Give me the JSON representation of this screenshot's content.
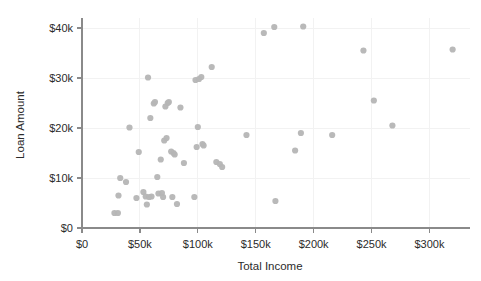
{
  "chart_data": {
    "type": "scatter",
    "title": "",
    "xlabel": "Total Income",
    "ylabel": "Loan Amount",
    "xlim": [
      0,
      335000
    ],
    "ylim": [
      0,
      42000
    ],
    "grid": true,
    "legend": null,
    "x_tick_labels": [
      "$0",
      "$50k",
      "$100k",
      "$150k",
      "$200k",
      "$250k",
      "$300k"
    ],
    "x_tick_values": [
      0,
      50000,
      100000,
      150000,
      200000,
      250000,
      300000
    ],
    "y_tick_labels": [
      "$0",
      "$10k",
      "$20k",
      "$30k",
      "$40k"
    ],
    "y_tick_values": [
      0,
      10000,
      20000,
      30000,
      40000
    ],
    "point_color": "#b5b5b5",
    "point_radius": 3.1,
    "series": [
      {
        "name": "loans",
        "points": [
          [
            28000,
            3000
          ],
          [
            31000,
            3000
          ],
          [
            31500,
            6500
          ],
          [
            33000,
            10000
          ],
          [
            38000,
            9200
          ],
          [
            41000,
            20100
          ],
          [
            47000,
            6000
          ],
          [
            49000,
            15200
          ],
          [
            53000,
            7200
          ],
          [
            55000,
            6300
          ],
          [
            56000,
            4700
          ],
          [
            57000,
            30100
          ],
          [
            58000,
            6200
          ],
          [
            59000,
            22000
          ],
          [
            60000,
            6300
          ],
          [
            62000,
            24900
          ],
          [
            63000,
            25200
          ],
          [
            65000,
            10200
          ],
          [
            66000,
            6900
          ],
          [
            68000,
            13700
          ],
          [
            69000,
            7000
          ],
          [
            70000,
            6200
          ],
          [
            71000,
            17500
          ],
          [
            72000,
            24300
          ],
          [
            73000,
            18000
          ],
          [
            74000,
            25000
          ],
          [
            75000,
            25200
          ],
          [
            77000,
            15300
          ],
          [
            78000,
            6200
          ],
          [
            79000,
            15000
          ],
          [
            80000,
            14700
          ],
          [
            82000,
            4800
          ],
          [
            85000,
            24100
          ],
          [
            88000,
            13000
          ],
          [
            97000,
            6200
          ],
          [
            98000,
            29600
          ],
          [
            99000,
            16200
          ],
          [
            100000,
            20200
          ],
          [
            101000,
            29800
          ],
          [
            103000,
            30200
          ],
          [
            104000,
            16800
          ],
          [
            105000,
            16500
          ],
          [
            112000,
            32200
          ],
          [
            116000,
            13200
          ],
          [
            119000,
            12800
          ],
          [
            121000,
            12200
          ],
          [
            142000,
            18600
          ],
          [
            157000,
            39000
          ],
          [
            166000,
            40200
          ],
          [
            167000,
            5400
          ],
          [
            184000,
            15500
          ],
          [
            189000,
            19000
          ],
          [
            191000,
            40300
          ],
          [
            216000,
            18600
          ],
          [
            243000,
            35500
          ],
          [
            252000,
            25500
          ],
          [
            268000,
            20500
          ],
          [
            320000,
            35700
          ]
        ]
      }
    ]
  }
}
